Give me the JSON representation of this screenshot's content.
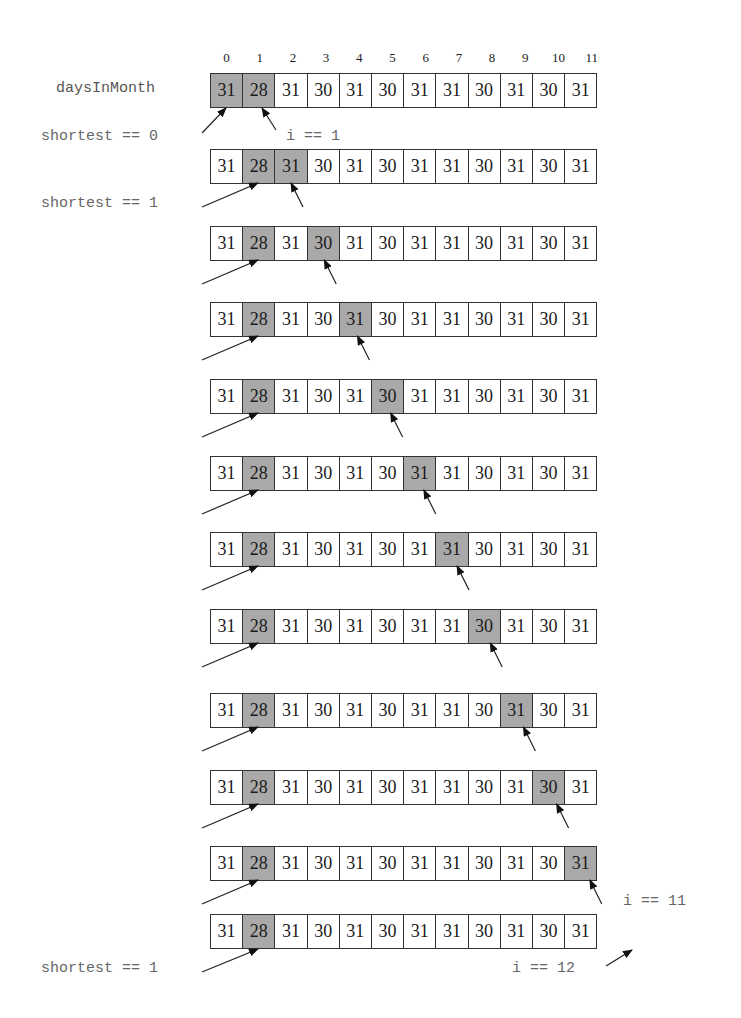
{
  "diagram": {
    "array_name": "daysInMonth",
    "indices": [
      "0",
      "1",
      "2",
      "3",
      "4",
      "5",
      "6",
      "7",
      "8",
      "9",
      "10",
      "11"
    ],
    "values": [
      "31",
      "28",
      "31",
      "30",
      "31",
      "30",
      "31",
      "31",
      "30",
      "31",
      "30",
      "31"
    ],
    "highlight_color": "#a9a9a9",
    "rows": [
      {
        "step": 0,
        "highlighted": [
          0,
          1
        ],
        "shortest": 0,
        "i": 1
      },
      {
        "step": 1,
        "highlighted": [
          1,
          2
        ],
        "shortest": 1,
        "i": 2
      },
      {
        "step": 2,
        "highlighted": [
          1,
          3
        ],
        "shortest": 1,
        "i": 3
      },
      {
        "step": 3,
        "highlighted": [
          1,
          4
        ],
        "shortest": 1,
        "i": 4
      },
      {
        "step": 4,
        "highlighted": [
          1,
          5
        ],
        "shortest": 1,
        "i": 5
      },
      {
        "step": 5,
        "highlighted": [
          1,
          6
        ],
        "shortest": 1,
        "i": 6
      },
      {
        "step": 6,
        "highlighted": [
          1,
          7
        ],
        "shortest": 1,
        "i": 7
      },
      {
        "step": 7,
        "highlighted": [
          1,
          8
        ],
        "shortest": 1,
        "i": 8
      },
      {
        "step": 8,
        "highlighted": [
          1,
          9
        ],
        "shortest": 1,
        "i": 9
      },
      {
        "step": 9,
        "highlighted": [
          1,
          10
        ],
        "shortest": 1,
        "i": 10
      },
      {
        "step": 10,
        "highlighted": [
          1,
          11
        ],
        "shortest": 1,
        "i": 11
      },
      {
        "step": 11,
        "highlighted": [
          1
        ],
        "shortest": 1,
        "i": 12
      }
    ],
    "labels": {
      "shortest_0": "shortest == 0",
      "i_1": "i == 1",
      "shortest_1_top": "shortest == 1",
      "i_11": "i == 11",
      "i_12": "i == 12",
      "shortest_1_bottom": "shortest == 1"
    }
  }
}
